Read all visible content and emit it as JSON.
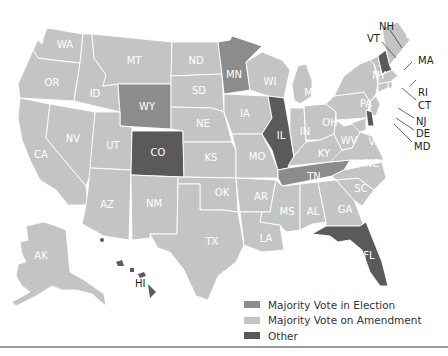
{
  "colors": {
    "election": "#8c8c8c",
    "amendment": "#c4c4c4",
    "other": "#5a5a5a",
    "border": "#ffffff",
    "background": "#ffffff"
  },
  "legend": {
    "items": [
      {
        "label": "Majority Vote in Election",
        "category": "election",
        "color": "#8c8c8c"
      },
      {
        "label": "Majority Vote on Amendment",
        "category": "amendment",
        "color": "#c4c4c4"
      },
      {
        "label": "Other",
        "category": "other",
        "color": "#5a5a5a"
      }
    ]
  },
  "states": {
    "WA": {
      "label": "WA",
      "category": "amendment"
    },
    "OR": {
      "label": "OR",
      "category": "amendment"
    },
    "CA": {
      "label": "CA",
      "category": "amendment"
    },
    "ID": {
      "label": "ID",
      "category": "amendment"
    },
    "NV": {
      "label": "NV",
      "category": "amendment"
    },
    "MT": {
      "label": "MT",
      "category": "amendment"
    },
    "WY": {
      "label": "WY",
      "category": "election"
    },
    "UT": {
      "label": "UT",
      "category": "amendment"
    },
    "AZ": {
      "label": "AZ",
      "category": "amendment"
    },
    "CO": {
      "label": "CO",
      "category": "other"
    },
    "NM": {
      "label": "NM",
      "category": "amendment"
    },
    "ND": {
      "label": "ND",
      "category": "amendment"
    },
    "SD": {
      "label": "SD",
      "category": "amendment"
    },
    "NE": {
      "label": "NE",
      "category": "amendment"
    },
    "KS": {
      "label": "KS",
      "category": "amendment"
    },
    "OK": {
      "label": "OK",
      "category": "amendment"
    },
    "TX": {
      "label": "TX",
      "category": "amendment"
    },
    "MN": {
      "label": "MN",
      "category": "election"
    },
    "IA": {
      "label": "IA",
      "category": "amendment"
    },
    "MO": {
      "label": "MO",
      "category": "amendment"
    },
    "AR": {
      "label": "AR",
      "category": "amendment"
    },
    "LA": {
      "label": "LA",
      "category": "amendment"
    },
    "WI": {
      "label": "WI",
      "category": "amendment"
    },
    "IL": {
      "label": "IL",
      "category": "other"
    },
    "MI": {
      "label": "MI",
      "category": "amendment"
    },
    "IN": {
      "label": "IN",
      "category": "amendment"
    },
    "OH": {
      "label": "OH",
      "category": "amendment"
    },
    "KY": {
      "label": "KY",
      "category": "amendment"
    },
    "TN": {
      "label": "TN",
      "category": "election"
    },
    "MS": {
      "label": "MS",
      "category": "amendment"
    },
    "AL": {
      "label": "AL",
      "category": "amendment"
    },
    "GA": {
      "label": "GA",
      "category": "amendment"
    },
    "FL": {
      "label": "FL",
      "category": "other"
    },
    "SC": {
      "label": "SC",
      "category": "amendment"
    },
    "NC": {
      "label": "NC",
      "category": "amendment"
    },
    "VA": {
      "label": "VA",
      "category": "amendment"
    },
    "WV": {
      "label": "WV",
      "category": "amendment"
    },
    "PA": {
      "label": "PA",
      "category": "amendment"
    },
    "NY": {
      "label": "NY",
      "category": "amendment"
    },
    "ME": {
      "label": "ME",
      "category": "amendment"
    },
    "NH": {
      "label": "NH",
      "category": "other"
    },
    "VT": {
      "label": "VT",
      "category": "amendment"
    },
    "MA": {
      "label": "MA",
      "category": "amendment"
    },
    "RI": {
      "label": "RI",
      "category": "amendment"
    },
    "CT": {
      "label": "CT",
      "category": "amendment"
    },
    "NJ": {
      "label": "NJ",
      "category": "amendment"
    },
    "DE": {
      "label": "DE",
      "category": "other"
    },
    "MD": {
      "label": "MD",
      "category": "amendment"
    },
    "AK": {
      "label": "AK",
      "category": "amendment"
    },
    "HI": {
      "label": "HI",
      "category": "other"
    }
  }
}
